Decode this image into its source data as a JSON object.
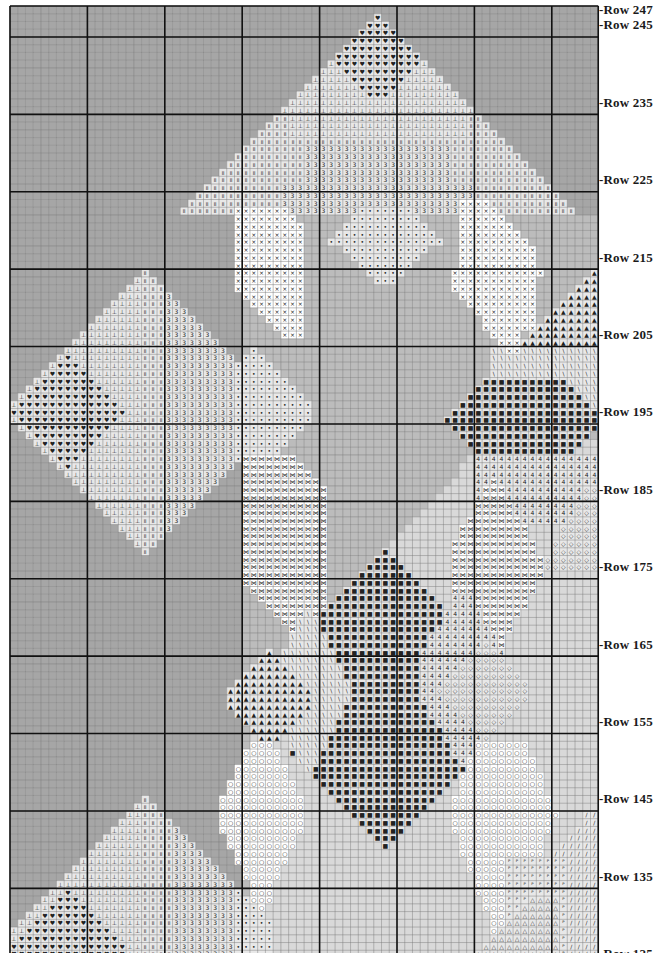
{
  "chart_data": {
    "type": "cross-stitch-pattern",
    "title": "",
    "grid": {
      "columns": 76,
      "rows": 123,
      "top_row_number": 247,
      "bottom_row_number": 125,
      "major_line_every": 10,
      "first_major_row": 245
    },
    "row_labels": [
      "-Row 247",
      "-Row 245",
      "-Row 235",
      "-Row 225",
      "-Row 215",
      "-Row 205",
      "-Row 195",
      "-Row 185",
      "-Row 175",
      "-Row 165",
      "-Row 155",
      "-Row 145",
      "-Row 135",
      "-Row 125"
    ],
    "row_label_values": [
      247,
      245,
      235,
      225,
      215,
      205,
      195,
      185,
      175,
      165,
      155,
      145,
      135,
      125
    ],
    "colors": {
      "bg_dark": "#a6a6a6",
      "bg_mid": "#bcbcbc",
      "bg_light": "#d9d9d9",
      "stitch_cell": "#e8e8e8",
      "white_cell": "#ffffff",
      "minor_line": "#7d7d7d",
      "major_line": "#111111",
      "symbol": "#222222"
    },
    "symbols": [
      {
        "key": "heart",
        "glyph": "♥"
      },
      {
        "key": "anchor",
        "glyph": "⊥"
      },
      {
        "key": "double-bar",
        "glyph": "॥"
      },
      {
        "key": "three",
        "glyph": "3"
      },
      {
        "key": "cross",
        "glyph": "×"
      },
      {
        "key": "dot",
        "glyph": "•"
      },
      {
        "key": "square",
        "glyph": "■"
      },
      {
        "key": "backslash",
        "glyph": "\\"
      },
      {
        "key": "four",
        "glyph": "4"
      },
      {
        "key": "diamond",
        "glyph": "◇"
      },
      {
        "key": "bowtie",
        "glyph": "⋈"
      },
      {
        "key": "triangle",
        "glyph": "▲"
      },
      {
        "key": "circle",
        "glyph": "○"
      },
      {
        "key": "slash",
        "glyph": "/"
      },
      {
        "key": "flag",
        "glyph": "ᴾ"
      },
      {
        "key": "delta",
        "glyph": "△"
      }
    ]
  }
}
